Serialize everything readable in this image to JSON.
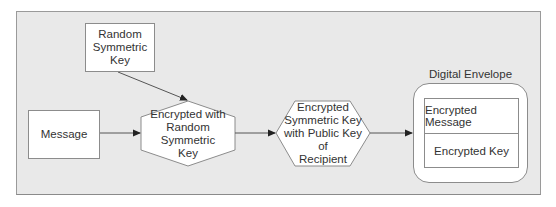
{
  "diagram": {
    "nodes": {
      "random_key": {
        "label": "Random Symmetric Key",
        "lines": [
          "Random",
          "Symmetric",
          "Key"
        ],
        "shape": "rectangle"
      },
      "message": {
        "label": "Message",
        "shape": "rectangle"
      },
      "encrypt_message": {
        "label": "Encrypted with Random Symmetric Key",
        "lines": [
          "Encrypted with",
          "Random Symmetric",
          "Key"
        ],
        "shape": "hexagon"
      },
      "encrypt_key": {
        "label": "Encrypted Symmetric Key with Public Key of Recipient",
        "lines": [
          "Encrypted",
          "Symmetric Key",
          "with Public Key of",
          "Recipient"
        ],
        "shape": "hexagon"
      },
      "envelope": {
        "title": "Digital Envelope",
        "shape": "rounded-rectangle",
        "rows": [
          "Encrypted Message",
          "Encrypted Key"
        ]
      }
    },
    "edges": [
      {
        "from": "random_key",
        "to": "encrypt_message"
      },
      {
        "from": "message",
        "to": "encrypt_message"
      },
      {
        "from": "encrypt_message",
        "to": "encrypt_key"
      },
      {
        "from": "encrypt_key",
        "to": "envelope"
      }
    ],
    "colors": {
      "panel_bg": "#e9e9e9",
      "node_fill": "#ffffff",
      "stroke": "#8c8c8c",
      "text": "#333333"
    }
  }
}
